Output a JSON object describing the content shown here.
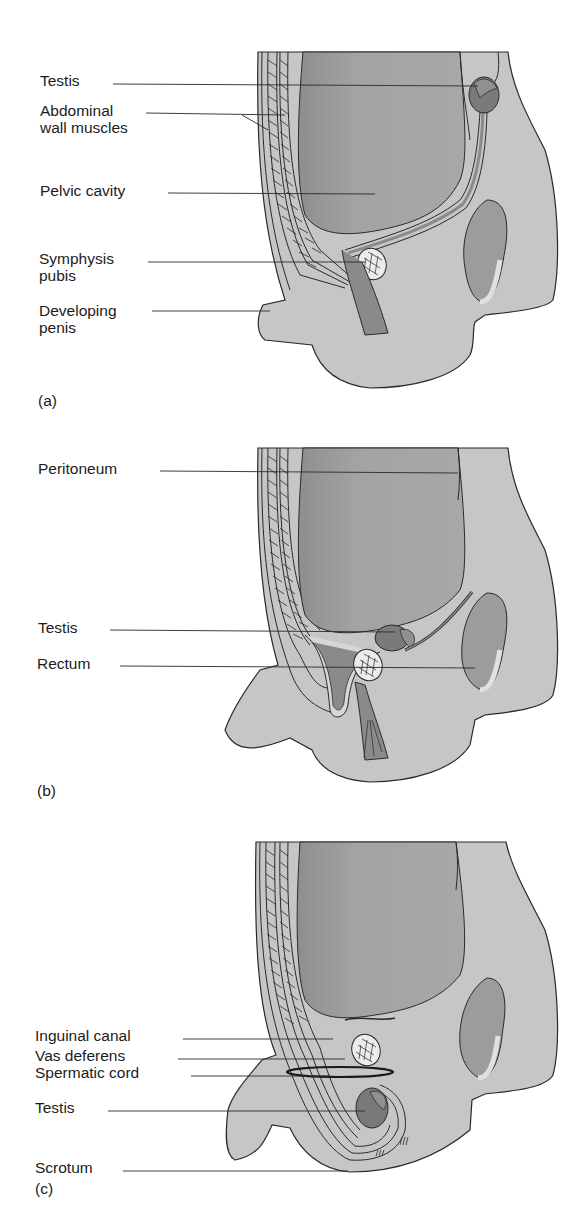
{
  "figure": {
    "panels": [
      {
        "id": "a",
        "letter": "(a)",
        "labels": [
          {
            "text": "Testis"
          },
          {
            "text": "Abdominal\nwall muscles"
          },
          {
            "text": "Pelvic cavity"
          },
          {
            "text": "Symphysis\npubis"
          },
          {
            "text": "Developing\npenis"
          }
        ]
      },
      {
        "id": "b",
        "letter": "(b)",
        "labels": [
          {
            "text": "Peritoneum"
          },
          {
            "text": "Testis"
          },
          {
            "text": "Rectum"
          }
        ]
      },
      {
        "id": "c",
        "letter": "(c)",
        "labels": [
          {
            "text": "Inguinal canal"
          },
          {
            "text": "Vas deferens"
          },
          {
            "text": "Spermatic cord"
          },
          {
            "text": "Testis"
          },
          {
            "text": "Scrotum"
          }
        ]
      }
    ],
    "colors": {
      "body": "#c8c8c8",
      "cavity": "#9a9a9a",
      "organ_dark": "#7e7e7e",
      "bone": "#e8e8e8",
      "outline": "#2a2a2a",
      "highlight": "#dedede"
    }
  }
}
